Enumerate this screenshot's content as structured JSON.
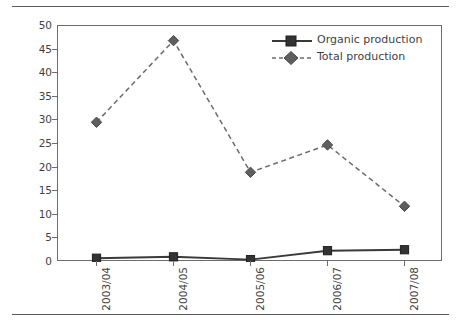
{
  "chart_data": {
    "type": "line",
    "title": "",
    "xlabel": "",
    "ylabel": "Production (thousand metric tons)",
    "categories": [
      "2003/04",
      "2004/05",
      "2005/06",
      "2006/07",
      "2007/08"
    ],
    "series": [
      {
        "name": "Organic production",
        "values": [
          0.8,
          1.1,
          0.5,
          2.4,
          2.6
        ],
        "marker": "square",
        "linestyle": "solid",
        "color": "#3a3a3a"
      },
      {
        "name": "Total production",
        "values": [
          29.6,
          46.9,
          19.0,
          24.8,
          11.8
        ],
        "marker": "diamond",
        "linestyle": "dashed",
        "color": "#6b6b6b"
      }
    ],
    "ylim": [
      0,
      50
    ],
    "yticks": [
      0,
      5,
      10,
      15,
      20,
      25,
      30,
      35,
      40,
      45,
      50
    ],
    "ytick_labels": [
      "0",
      "5",
      "10",
      "15",
      "20",
      "25",
      "30",
      "35",
      "40",
      "45",
      "50"
    ],
    "grid": false,
    "legend_position": "top-right",
    "legend_entries": [
      "Organic production",
      "Total production"
    ]
  },
  "figure": {
    "axis_color": "#6d6d6d",
    "rule_color": "#5a5a5a",
    "text_color": "#3f3f3f",
    "background": "#ffffff"
  }
}
